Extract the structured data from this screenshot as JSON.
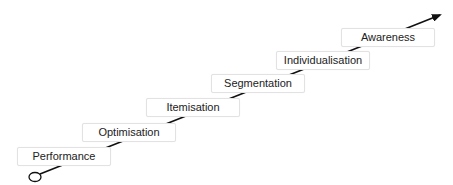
{
  "diagram": {
    "type": "staircase-progression",
    "steps": [
      {
        "label": "Performance"
      },
      {
        "label": "Optimisation"
      },
      {
        "label": "Itemisation"
      },
      {
        "label": "Segmentation"
      },
      {
        "label": "Individualisation"
      },
      {
        "label": "Awareness"
      }
    ],
    "colors": {
      "line": "#111111",
      "box_border": "#e2e2e2",
      "text": "#222222"
    }
  }
}
